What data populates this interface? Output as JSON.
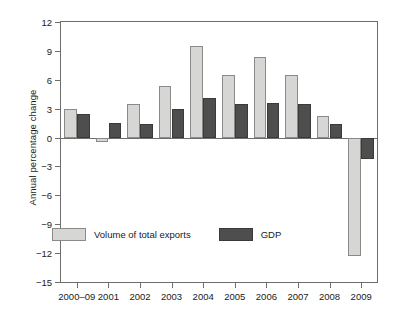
{
  "chart_data": {
    "type": "bar",
    "title": "",
    "xlabel": "",
    "ylabel": "Annual percentage change",
    "ylim": [
      -15,
      12
    ],
    "yticks": [
      12,
      9,
      6,
      3,
      0,
      -3,
      -6,
      -9,
      -12,
      -15
    ],
    "ytick_labels": [
      "12",
      "9",
      "6",
      "3",
      "0",
      "−3",
      "−6",
      "−9",
      "−12",
      "−15"
    ],
    "grid": false,
    "legend_position": "inside-bottom-left",
    "categories": [
      "2000–09",
      "2001",
      "2002",
      "2003",
      "2004",
      "2005",
      "2006",
      "2007",
      "2008",
      "2009"
    ],
    "series": [
      {
        "name": "Volume of total exports",
        "color": "#d6d6d4",
        "values": [
          3.0,
          -0.5,
          3.5,
          5.4,
          9.5,
          6.5,
          8.4,
          6.5,
          2.2,
          -12.3
        ]
      },
      {
        "name": "GDP",
        "color": "#4e4e4e",
        "values": [
          2.4,
          1.5,
          1.4,
          3.0,
          4.1,
          3.5,
          3.6,
          3.5,
          1.4,
          -2.2
        ]
      }
    ]
  }
}
